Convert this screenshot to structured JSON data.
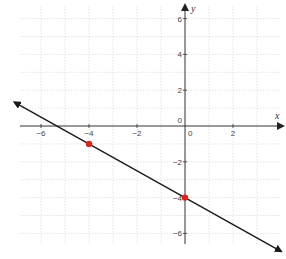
{
  "chart_data": {
    "type": "line",
    "title": "",
    "xlabel": "x",
    "ylabel": "y",
    "xlim": [
      -6.8,
      4
    ],
    "ylim": [
      -6.6,
      6.8
    ],
    "grid": true,
    "x_ticks": [
      -6,
      -4,
      -2,
      0,
      2
    ],
    "y_ticks": [
      6,
      4,
      2,
      0,
      -2,
      -4,
      -6
    ],
    "x_tick_labels": [
      "−6",
      "−4",
      "−2",
      "0",
      "2"
    ],
    "y_tick_labels": [
      "6",
      "4",
      "2",
      "0",
      "−2",
      "−4",
      "−6"
    ],
    "series": [
      {
        "name": "line",
        "equation": "y = -0.75x - 4",
        "slope": -0.75,
        "intercept": -4,
        "x": [
          -7,
          4
        ],
        "y": [
          1.25,
          -7
        ],
        "arrows": "both",
        "color": "#1a1a1a"
      }
    ],
    "points": [
      {
        "x": -4,
        "y": -1,
        "color": "#d9261c"
      },
      {
        "x": 0,
        "y": -4,
        "color": "#d9261c"
      }
    ]
  },
  "colors": {
    "axis": "#333333",
    "grid": "#d0d0d0",
    "line": "#1a1a1a",
    "point": "#d9261c"
  }
}
